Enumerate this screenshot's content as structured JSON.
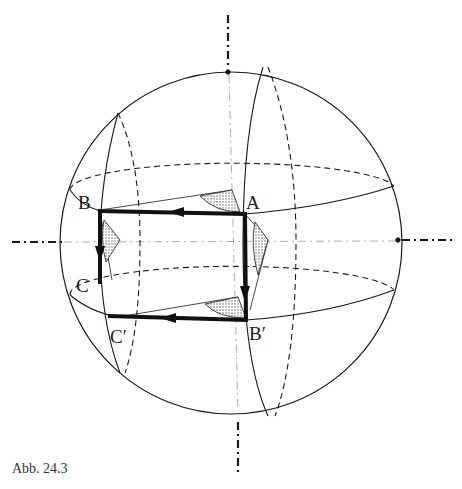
{
  "figure": {
    "caption": "Abb. 24.3",
    "labels": {
      "A": "A",
      "B": "B",
      "C": "C",
      "B_prime": "B′",
      "C_prime": "C′"
    },
    "colors": {
      "line": "#1a1a1a",
      "path": "#111111",
      "stipple": "#9a9a9a"
    }
  }
}
